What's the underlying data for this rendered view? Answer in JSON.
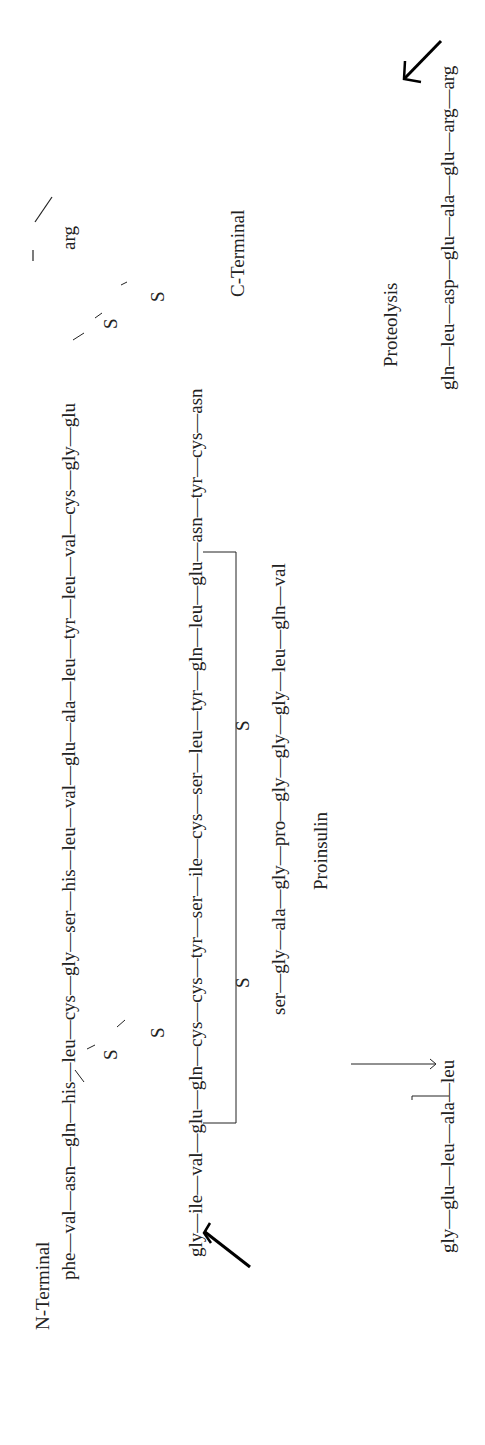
{
  "labels": {
    "n_terminal": "N-Terminal",
    "c_terminal": "C-Terminal",
    "proinsulin": "Proinsulin",
    "proteolysis": "Proteolysis",
    "s": "S"
  },
  "b_chain": "phe—val—asn—gln—his—leu—cys—gly—ser—his—leu—val—glu—ala—leu—tyr—leu—val—cys—gly—glu",
  "b_to_c_link": "arg",
  "right_column": [
    "gly",
    "phe",
    "phe",
    "tyr",
    "thr",
    "pro",
    "lys",
    "thr",
    "arg"
  ],
  "c_peptide_bottom": "gln—leu—asp—glu—ala—glu—arg—arg",
  "c_peptide_return_column": [
    "val",
    "gly",
    "gln"
  ],
  "c_peptide_middle": "ser—gly—ala—gly—pro—gly—gly—gly—leu—gln—val",
  "c_left_column": [
    "leu",
    "gln",
    "pro"
  ],
  "c_peptide_low": "gly—glu—leu—ala—leu",
  "a_chain": "gly—ile—val—glu—gln—cys—cys—tyr—ser—ile—cys—ser—leu—tyr—gln—leu—glu—asn—tyr—cys—asn",
  "left_column": [
    "arg",
    "lys",
    "gln",
    "leu",
    "ser"
  ]
}
